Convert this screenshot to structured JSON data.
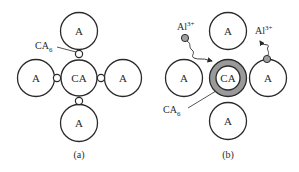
{
  "colors": {
    "stroke": "#2a2a2a",
    "ring_fill": "#9a9a9a",
    "ion_fill": "#a0a0a0",
    "background": "#ffffff"
  },
  "panel_a": {
    "caption": "(a)",
    "center_label": "CA",
    "neighbors": [
      {
        "position": "top",
        "label": "A"
      },
      {
        "position": "left",
        "label": "A"
      },
      {
        "position": "right",
        "label": "A"
      },
      {
        "position": "bottom",
        "label": "A"
      }
    ],
    "product_label": {
      "base": "CA",
      "sub": "6"
    }
  },
  "panel_b": {
    "caption": "(b)",
    "center_label": "CA",
    "neighbors": [
      {
        "position": "top",
        "label": "A"
      },
      {
        "position": "left",
        "label": "A"
      },
      {
        "position": "right",
        "label": "A"
      },
      {
        "position": "bottom",
        "label": "A"
      }
    ],
    "product_label": {
      "base": "CA",
      "sub": "6"
    },
    "ions": [
      {
        "base": "Al",
        "sup": "3+",
        "side": "left"
      },
      {
        "base": "Al",
        "sup": "3+",
        "side": "right"
      }
    ]
  }
}
